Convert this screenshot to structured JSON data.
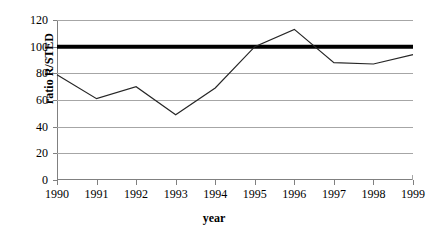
{
  "chart_data": {
    "type": "line",
    "title": "",
    "xlabel": "year",
    "ylabel": "ratio R/STED",
    "categories": [
      "1990",
      "1991",
      "1992",
      "1993",
      "1994",
      "1995",
      "1996",
      "1997",
      "1998",
      "1999"
    ],
    "x": [
      1990,
      1991,
      1992,
      1993,
      1994,
      1995,
      1996,
      1997,
      1998,
      1999
    ],
    "series": [
      {
        "name": "ratio R/STED",
        "values": [
          79,
          61,
          70,
          49,
          69,
          100,
          113,
          88,
          87,
          94
        ],
        "color": "#262626",
        "line_width": 1.2
      },
      {
        "name": "reference-line-100",
        "values": [
          100,
          100,
          100,
          100,
          100,
          100,
          100,
          100,
          100,
          100
        ],
        "color": "#000000",
        "line_width": 4
      }
    ],
    "ylim": [
      0,
      120
    ],
    "xlim": [
      1990,
      1999
    ],
    "yticks": [
      0,
      20,
      40,
      60,
      80,
      100,
      120
    ],
    "ytick_labels": [
      "0",
      "20",
      "40",
      "60",
      "80",
      "100",
      "120"
    ],
    "grid": true,
    "grid_axis": "y",
    "legend": "none",
    "grid_color": "#a6a6a6",
    "axis_color": "#808080",
    "background": "#ffffff"
  }
}
